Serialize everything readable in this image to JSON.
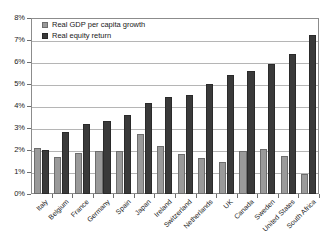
{
  "chart_data": {
    "type": "bar",
    "title": "",
    "subtitle": "",
    "xlabel": "",
    "ylabel": "",
    "ylim": [
      0,
      8
    ],
    "y_tick_labels": [
      "0%",
      "1%",
      "2%",
      "3%",
      "4%",
      "5%",
      "6%",
      "7%",
      "8%"
    ],
    "y_ticks": [
      0,
      1,
      2,
      3,
      4,
      5,
      6,
      7,
      8
    ],
    "grid": true,
    "legend_position": "top-left",
    "categories": [
      "Italy",
      "Belgium",
      "France",
      "Germany",
      "Spain",
      "Japan",
      "Ireland",
      "Switzerland",
      "Netherlands",
      "UK",
      "Canada",
      "Sweden",
      "United States",
      "South Africa"
    ],
    "series": [
      {
        "name": "Real GDP per capita growth",
        "color": "#9a9a9a",
        "values": [
          2.1,
          1.7,
          1.85,
          1.95,
          1.95,
          2.75,
          2.2,
          1.8,
          1.65,
          1.45,
          1.95,
          2.05,
          1.75,
          0.9
        ]
      },
      {
        "name": "Real equity return",
        "color": "#3a3a3a",
        "values": [
          2.0,
          2.8,
          3.2,
          3.3,
          3.6,
          4.15,
          4.4,
          4.5,
          5.0,
          5.4,
          5.6,
          5.9,
          6.35,
          7.25
        ]
      }
    ]
  }
}
